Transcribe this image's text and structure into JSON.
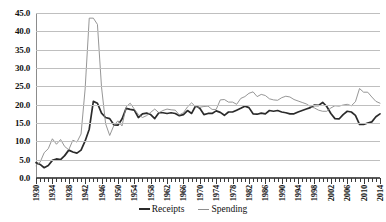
{
  "chart_data": {
    "type": "line",
    "title": "",
    "xlabel": "",
    "ylabel": "",
    "ylim": [
      0.0,
      45.0
    ],
    "xlim": [
      1930,
      2014
    ],
    "yticks": [
      "0.0",
      "5.0",
      "10.0",
      "15.0",
      "20.0",
      "25.0",
      "30.0",
      "35.0",
      "40.0",
      "45.0"
    ],
    "ytick_values": [
      0,
      5,
      10,
      15,
      20,
      25,
      30,
      35,
      40,
      45
    ],
    "grid": true,
    "legend_position": "bottom-center",
    "x": [
      1930,
      1931,
      1932,
      1933,
      1934,
      1935,
      1936,
      1937,
      1938,
      1939,
      1940,
      1941,
      1942,
      1943,
      1944,
      1945,
      1946,
      1947,
      1948,
      1949,
      1950,
      1951,
      1952,
      1953,
      1954,
      1955,
      1956,
      1957,
      1958,
      1959,
      1960,
      1961,
      1962,
      1963,
      1964,
      1965,
      1966,
      1967,
      1968,
      1969,
      1970,
      1971,
      1972,
      1973,
      1974,
      1975,
      1976,
      1977,
      1978,
      1979,
      1980,
      1981,
      1982,
      1983,
      1984,
      1985,
      1986,
      1987,
      1988,
      1989,
      1990,
      1991,
      1992,
      1993,
      1994,
      1995,
      1996,
      1997,
      1998,
      1999,
      2000,
      2001,
      2002,
      2003,
      2004,
      2005,
      2006,
      2007,
      2008,
      2009,
      2010,
      2011,
      2012,
      2013,
      2014
    ],
    "xtick_labels": [
      "1930",
      "1934",
      "1938",
      "1942",
      "1946",
      "1950",
      "1954",
      "1958",
      "1962",
      "1966",
      "1970",
      "1974",
      "1978",
      "1982",
      "1986",
      "1990",
      "1994",
      "1998",
      "2002",
      "2006",
      "2010",
      "2014"
    ],
    "xtick_values": [
      1930,
      1934,
      1938,
      1942,
      1946,
      1950,
      1954,
      1958,
      1962,
      1966,
      1970,
      1974,
      1978,
      1982,
      1986,
      1990,
      1994,
      1998,
      2002,
      2006,
      2010,
      2014
    ],
    "series": [
      {
        "name": "Receipts",
        "color": "#2b2b2b",
        "width": "thick",
        "values": [
          4.2,
          3.7,
          2.8,
          3.4,
          4.8,
          5.2,
          5.0,
          6.1,
          7.6,
          7.1,
          6.8,
          7.6,
          10.1,
          13.3,
          20.9,
          20.4,
          17.7,
          16.5,
          16.2,
          14.5,
          14.4,
          16.1,
          19.0,
          18.7,
          18.5,
          16.5,
          17.5,
          17.7,
          17.3,
          16.2,
          17.8,
          17.8,
          17.6,
          17.8,
          17.6,
          17.0,
          17.3,
          18.4,
          17.6,
          19.7,
          19.0,
          17.3,
          17.6,
          17.6,
          18.3,
          17.9,
          17.1,
          18.0,
          18.0,
          18.5,
          19.0,
          19.6,
          19.2,
          17.5,
          17.4,
          17.7,
          17.5,
          18.4,
          18.2,
          18.4,
          18.0,
          17.8,
          17.5,
          17.5,
          18.0,
          18.4,
          18.8,
          19.2,
          19.9,
          19.8,
          20.6,
          19.5,
          17.6,
          16.2,
          16.1,
          17.3,
          18.2,
          18.0,
          17.1,
          14.6,
          14.6,
          15.0,
          15.3,
          16.7,
          17.5
        ]
      },
      {
        "name": "Spending",
        "color": "#8a8a8a",
        "width": "thin",
        "values": [
          3.4,
          4.3,
          6.9,
          8.0,
          10.7,
          9.2,
          10.5,
          8.6,
          7.7,
          10.3,
          9.8,
          12.0,
          24.3,
          43.6,
          43.6,
          41.9,
          24.8,
          14.8,
          11.6,
          14.3,
          15.6,
          14.2,
          19.4,
          20.4,
          18.8,
          17.3,
          16.5,
          17.0,
          17.9,
          18.8,
          17.8,
          18.4,
          18.8,
          18.6,
          18.5,
          17.2,
          17.8,
          19.4,
          20.5,
          19.4,
          19.3,
          19.5,
          19.6,
          18.7,
          18.7,
          21.3,
          21.4,
          20.7,
          20.7,
          20.1,
          21.7,
          22.2,
          23.1,
          23.5,
          22.2,
          22.8,
          22.5,
          21.6,
          21.3,
          21.2,
          21.9,
          22.3,
          22.1,
          21.4,
          21.0,
          20.6,
          20.2,
          19.5,
          19.1,
          18.5,
          18.2,
          18.2,
          19.1,
          19.7,
          19.6,
          19.9,
          20.1,
          19.7,
          20.8,
          24.4,
          23.4,
          23.4,
          22.1,
          20.9,
          20.4
        ]
      }
    ]
  },
  "legend": {
    "items": [
      {
        "label": "Receipts"
      },
      {
        "label": "Spending"
      }
    ]
  }
}
